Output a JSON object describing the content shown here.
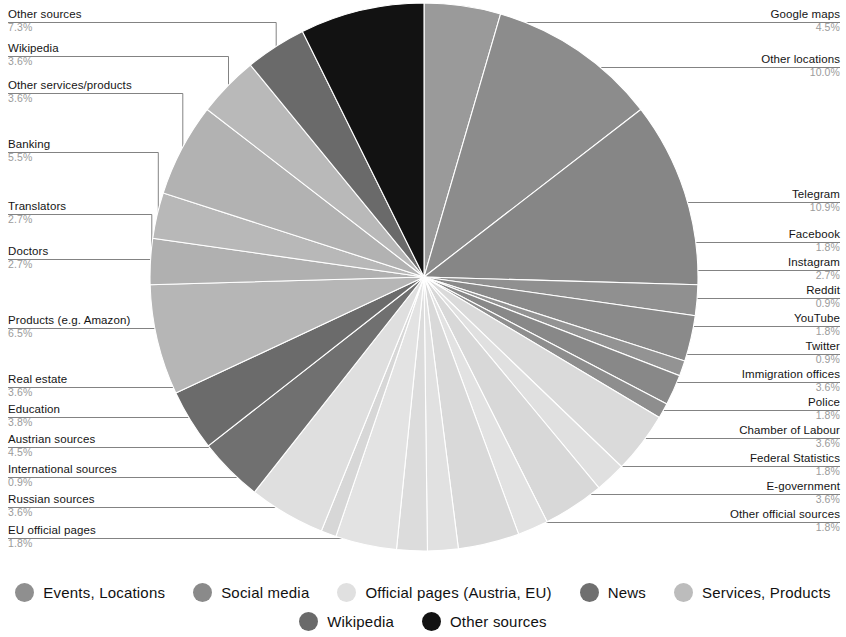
{
  "chart_data": {
    "type": "pie",
    "title": "",
    "subtitle": "",
    "total_percent": 100.0,
    "start_angle_deg": 0,
    "direction": "clockwise",
    "center": {
      "x": 424,
      "y": 277
    },
    "radius": 274,
    "legend_position": "bottom",
    "grid": false,
    "groups": [
      {
        "name": "Events, Locations",
        "color": "#8f8f8f"
      },
      {
        "name": "Social media",
        "color": "#8a8a8a"
      },
      {
        "name": "Official pages (Austria, EU)",
        "color": "#dcdcdc"
      },
      {
        "name": "News",
        "color": "#6f6f6f"
      },
      {
        "name": "Services, Products",
        "color": "#b4b4b4"
      },
      {
        "name": "Wikipedia",
        "color": "#6a6a6a"
      },
      {
        "name": "Other sources",
        "color": "#121212"
      }
    ],
    "slices": [
      {
        "label": "Google maps",
        "value": 4.5,
        "pct": "4.5%",
        "group": "Events, Locations",
        "color": "#9a9a9a",
        "side": "right"
      },
      {
        "label": "Other locations",
        "value": 10.0,
        "pct": "10.0%",
        "group": "Events, Locations",
        "color": "#8c8c8c",
        "side": "right"
      },
      {
        "label": "Telegram",
        "value": 10.9,
        "pct": "10.9%",
        "group": "Social media",
        "color": "#868686",
        "side": "right"
      },
      {
        "label": "Facebook",
        "value": 1.8,
        "pct": "1.8%",
        "group": "Social media",
        "color": "#909090",
        "side": "right"
      },
      {
        "label": "Instagram",
        "value": 2.7,
        "pct": "2.7%",
        "group": "Social media",
        "color": "#8a8a8a",
        "side": "right"
      },
      {
        "label": "Reddit",
        "value": 0.9,
        "pct": "0.9%",
        "group": "Social media",
        "color": "#939393",
        "side": "right"
      },
      {
        "label": "YouTube",
        "value": 1.8,
        "pct": "1.8%",
        "group": "Social media",
        "color": "#888888",
        "side": "right"
      },
      {
        "label": "Twitter",
        "value": 0.9,
        "pct": "0.9%",
        "group": "Social media",
        "color": "#8e8e8e",
        "side": "right"
      },
      {
        "label": "Immigration offices",
        "value": 3.6,
        "pct": "3.6%",
        "group": "Official pages (Austria, EU)",
        "color": "#dadada",
        "side": "right"
      },
      {
        "label": "Police",
        "value": 1.8,
        "pct": "1.8%",
        "group": "Official pages (Austria, EU)",
        "color": "#e0e0e0",
        "side": "right"
      },
      {
        "label": "Chamber of Labour",
        "value": 3.6,
        "pct": "3.6%",
        "group": "Official pages (Austria, EU)",
        "color": "#d8d8d8",
        "side": "right"
      },
      {
        "label": "Federal Statistics",
        "value": 1.8,
        "pct": "1.8%",
        "group": "Official pages (Austria, EU)",
        "color": "#e2e2e2",
        "side": "right"
      },
      {
        "label": "E-government",
        "value": 3.6,
        "pct": "3.6%",
        "group": "Official pages (Austria, EU)",
        "color": "#d9d9d9",
        "side": "right"
      },
      {
        "label": "Other official sources",
        "value": 1.8,
        "pct": "1.8%",
        "group": "Official pages (Austria, EU)",
        "color": "#e1e1e1",
        "side": "right"
      },
      {
        "label": "EU official pages",
        "value": 1.8,
        "pct": "1.8%",
        "group": "Official pages (Austria, EU)",
        "color": "#dcdcdc",
        "side": "left"
      },
      {
        "label": "Russian sources",
        "value": 3.6,
        "pct": "3.6%",
        "group": "Official pages (Austria, EU)",
        "color": "#e3e3e3",
        "side": "left"
      },
      {
        "label": "International sources",
        "value": 0.9,
        "pct": "0.9%",
        "group": "Official pages (Austria, EU)",
        "color": "#d7d7d7",
        "side": "left"
      },
      {
        "label": "Austrian sources",
        "value": 4.5,
        "pct": "4.5%",
        "group": "Official pages (Austria, EU)",
        "color": "#dfdfdf",
        "side": "left"
      },
      {
        "label": "Education",
        "value": 3.8,
        "pct": "3.8%",
        "group": "News",
        "color": "#707070",
        "side": "left"
      },
      {
        "label": "Real estate",
        "value": 3.6,
        "pct": "3.6%",
        "group": "News",
        "color": "#6b6b6b",
        "side": "left"
      },
      {
        "label": "Products (e.g. Amazon)",
        "value": 6.5,
        "pct": "6.5%",
        "group": "Services, Products",
        "color": "#b6b6b6",
        "side": "left"
      },
      {
        "label": "Doctors",
        "value": 2.7,
        "pct": "2.7%",
        "group": "Services, Products",
        "color": "#b0b0b0",
        "side": "left"
      },
      {
        "label": "Translators",
        "value": 2.7,
        "pct": "2.7%",
        "group": "Services, Products",
        "color": "#b8b8b8",
        "side": "left"
      },
      {
        "label": "Banking",
        "value": 5.5,
        "pct": "5.5%",
        "group": "Services, Products",
        "color": "#b2b2b2",
        "side": "left"
      },
      {
        "label": "Other services/products",
        "value": 3.6,
        "pct": "3.6%",
        "group": "Services, Products",
        "color": "#b9b9b9",
        "side": "left"
      },
      {
        "label": "Wikipedia",
        "value": 3.6,
        "pct": "3.6%",
        "group": "Wikipedia",
        "color": "#6a6a6a",
        "side": "left"
      },
      {
        "label": "Other sources",
        "value": 7.3,
        "pct": "7.3%",
        "group": "Other sources",
        "color": "#121212",
        "side": "left"
      }
    ]
  },
  "labels": {
    "right": [
      {
        "name": "Google maps",
        "pct": "4.5%",
        "y": 8,
        "anchor_index": 0
      },
      {
        "name": "Other locations",
        "pct": "10.0%",
        "y": 53,
        "anchor_index": 1
      },
      {
        "name": "Telegram",
        "pct": "10.9%",
        "y": 188,
        "anchor_index": 2
      },
      {
        "name": "Facebook",
        "pct": "1.8%",
        "y": 228,
        "anchor_index": 3
      },
      {
        "name": "Instagram",
        "pct": "2.7%",
        "y": 256,
        "anchor_index": 4
      },
      {
        "name": "Reddit",
        "pct": "0.9%",
        "y": 284,
        "anchor_index": 5
      },
      {
        "name": "YouTube",
        "pct": "1.8%",
        "y": 312,
        "anchor_index": 6
      },
      {
        "name": "Twitter",
        "pct": "0.9%",
        "y": 340,
        "anchor_index": 7
      },
      {
        "name": "Immigration offices",
        "pct": "3.6%",
        "y": 368,
        "anchor_index": 8
      },
      {
        "name": "Police",
        "pct": "1.8%",
        "y": 396,
        "anchor_index": 9
      },
      {
        "name": "Chamber of Labour",
        "pct": "3.6%",
        "y": 424,
        "anchor_index": 10
      },
      {
        "name": "Federal Statistics",
        "pct": "1.8%",
        "y": 452,
        "anchor_index": 11
      },
      {
        "name": "E-government",
        "pct": "3.6%",
        "y": 480,
        "anchor_index": 12
      },
      {
        "name": "Other official sources",
        "pct": "1.8%",
        "y": 508,
        "anchor_index": 13
      }
    ],
    "left": [
      {
        "name": "Other sources",
        "pct": "7.3%",
        "y": 8,
        "anchor_index": 26
      },
      {
        "name": "Wikipedia",
        "pct": "3.6%",
        "y": 42,
        "anchor_index": 25
      },
      {
        "name": "Other services/products",
        "pct": "3.6%",
        "y": 79,
        "anchor_index": 24
      },
      {
        "name": "Banking",
        "pct": "5.5%",
        "y": 138,
        "anchor_index": 23
      },
      {
        "name": "Translators",
        "pct": "2.7%",
        "y": 200,
        "anchor_index": 22
      },
      {
        "name": "Doctors",
        "pct": "2.7%",
        "y": 245,
        "anchor_index": 21
      },
      {
        "name": "Products (e.g. Amazon)",
        "pct": "6.5%",
        "y": 314,
        "anchor_index": 20
      },
      {
        "name": "Real estate",
        "pct": "3.6%",
        "y": 373,
        "anchor_index": 19
      },
      {
        "name": "Education",
        "pct": "3.8%",
        "y": 403,
        "anchor_index": 18
      },
      {
        "name": "Austrian sources",
        "pct": "4.5%",
        "y": 433,
        "anchor_index": 17
      },
      {
        "name": "International sources",
        "pct": "0.9%",
        "y": 463,
        "anchor_index": 16
      },
      {
        "name": "Russian sources",
        "pct": "3.6%",
        "y": 493,
        "anchor_index": 15
      },
      {
        "name": "EU official pages",
        "pct": "1.8%",
        "y": 524,
        "anchor_index": 14
      }
    ]
  },
  "legend": {
    "row1": [
      {
        "label": "Events, Locations",
        "color": "#8f8f8f"
      },
      {
        "label": "Social media",
        "color": "#8a8a8a"
      },
      {
        "label": "Official pages (Austria, EU)",
        "color": "#e0e0e0"
      },
      {
        "label": "News",
        "color": "#6f6f6f"
      },
      {
        "label": "Services, Products",
        "color": "#bcbcbc"
      }
    ],
    "row2": [
      {
        "label": "Wikipedia",
        "color": "#6a6a6a"
      },
      {
        "label": "Other sources",
        "color": "#121212"
      }
    ]
  }
}
